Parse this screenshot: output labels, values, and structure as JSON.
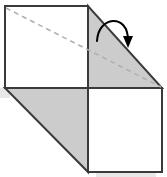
{
  "figure": {
    "canvas": {
      "width": 167,
      "height": 177
    },
    "colors": {
      "outline": "#3a3a3a",
      "gray_fill": "#cccccc",
      "white_fill": "#ffffff",
      "dashed_line": "#b0b0b0",
      "shadow": "#e8e8e8",
      "arrow": "#000000"
    },
    "shapes": {
      "top_left_square": {
        "name": "top-left-square",
        "fill": "white",
        "points": "5,6 88,6 88,88 5,88"
      },
      "top_right_triangle": {
        "name": "top-right-triangle",
        "fill": "gray",
        "points": "88,6 88,88 162,88"
      },
      "bottom_left_triangle": {
        "name": "bottom-left-triangle",
        "fill": "gray",
        "points": "5,88 88,88 88,172"
      },
      "bottom_right_square": {
        "name": "bottom-right-square",
        "fill": "white",
        "points": "88,88 162,88 162,172 88,172"
      }
    },
    "dashed_diagonal": {
      "x1": 6,
      "y1": 8,
      "x2": 161,
      "y2": 87
    },
    "fold_arrow": {
      "path": "M 97,41 C 98,16 128,13 128,40",
      "arrowhead_tip": {
        "x": 128,
        "y": 48
      }
    },
    "shadows": [
      {
        "name": "left-shadow",
        "x": 0,
        "y": 88,
        "width": 10,
        "height": 10
      },
      {
        "name": "bottom-shadow",
        "x": 96,
        "y": 172,
        "width": 60,
        "height": 5
      }
    ]
  }
}
